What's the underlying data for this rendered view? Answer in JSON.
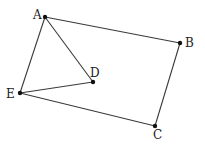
{
  "diagram": {
    "type": "geometry-figure",
    "background": "#ffffff",
    "line_color": "#3a3a3a",
    "point_color": "#111111",
    "points": [
      {
        "id": "A",
        "label": "A",
        "x": 45,
        "y": 17,
        "lx": 33,
        "ly": 19
      },
      {
        "id": "B",
        "label": "B",
        "x": 180,
        "y": 43,
        "lx": 185,
        "ly": 47
      },
      {
        "id": "C",
        "label": "C",
        "x": 155,
        "y": 126,
        "lx": 153,
        "ly": 139
      },
      {
        "id": "D",
        "label": "D",
        "x": 93,
        "y": 82,
        "lx": 90,
        "ly": 77
      },
      {
        "id": "E",
        "label": "E",
        "x": 20,
        "y": 93,
        "lx": 6,
        "ly": 98
      }
    ],
    "edges": [
      [
        "A",
        "B"
      ],
      [
        "B",
        "C"
      ],
      [
        "C",
        "E"
      ],
      [
        "E",
        "A"
      ],
      [
        "A",
        "D"
      ],
      [
        "D",
        "E"
      ]
    ]
  }
}
